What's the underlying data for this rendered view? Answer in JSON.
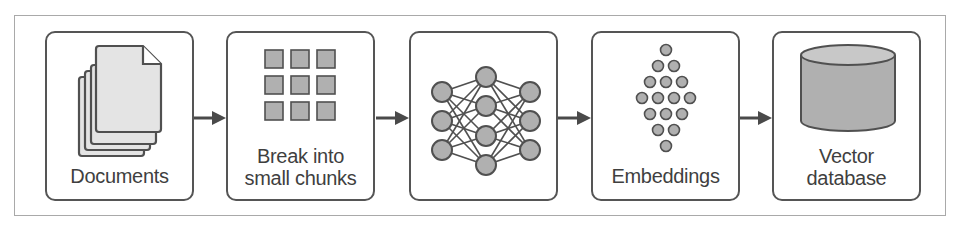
{
  "diagram": {
    "colors": {
      "frame": "#a9a9a9",
      "box_border": "#555555",
      "icon_fill": "#b0b0b0",
      "icon_stroke": "#505050",
      "page_fill": "#e4e4e4",
      "text": "#3f3f3f"
    },
    "steps": [
      {
        "id": "documents",
        "icon": "document-stack-icon",
        "label_lines": [
          "Documents"
        ]
      },
      {
        "id": "chunks",
        "icon": "grid-chunks-icon",
        "label_lines": [
          "Break into",
          "small chunks"
        ]
      },
      {
        "id": "model",
        "icon": "neural-network-icon",
        "label_lines": []
      },
      {
        "id": "embeddings",
        "icon": "dot-diamond-icon",
        "label_lines": [
          "Embeddings"
        ]
      },
      {
        "id": "vector-db",
        "icon": "database-cylinder-icon",
        "label_lines": [
          "Vector",
          "database"
        ]
      }
    ],
    "arrows": [
      {
        "from": "documents",
        "to": "chunks"
      },
      {
        "from": "chunks",
        "to": "model"
      },
      {
        "from": "model",
        "to": "embeddings"
      },
      {
        "from": "embeddings",
        "to": "vector-db"
      }
    ]
  }
}
